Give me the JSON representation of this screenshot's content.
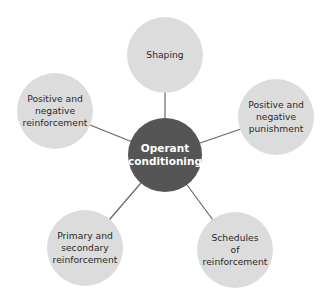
{
  "diagram": {
    "center": {
      "label": "Operant\nconditioning",
      "color": "#555555"
    },
    "nodes": [
      {
        "id": "shaping",
        "label": "Shaping"
      },
      {
        "id": "pos-neg-reinforcement",
        "label": "Positive and\nnegative\nreinforcement"
      },
      {
        "id": "pos-neg-punishment",
        "label": "Positive and\nnegative\npunishment"
      },
      {
        "id": "primary-secondary",
        "label": "Primary and\nsecondary\nreinforcement"
      },
      {
        "id": "schedules",
        "label": "Schedules\nof\nreinforcement"
      }
    ],
    "node_color": "#dcdcdc",
    "line_color": "#666666"
  }
}
